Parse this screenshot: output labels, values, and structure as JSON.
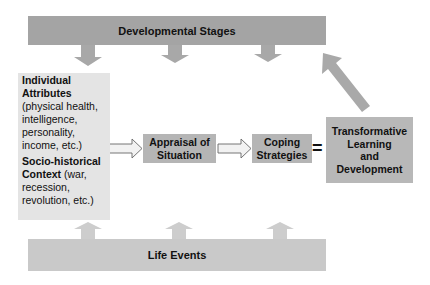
{
  "diagram": {
    "top_bar": {
      "label": "Developmental Stages"
    },
    "bottom_bar": {
      "label": "Life Events"
    },
    "left_box": {
      "attributes_title": "Individual Attributes",
      "attributes_detail": "(physical health, intelligence, personality, income, etc.)",
      "context_title": "Socio-historical Context",
      "context_detail": "(war, recession, revolution, etc.)"
    },
    "appraisal": {
      "label": "Appraisal of Situation"
    },
    "coping": {
      "label": "Coping Strategies"
    },
    "equals": {
      "symbol": "="
    },
    "outcome": {
      "line1": "Transformative",
      "line2": "Learning",
      "line3": "and",
      "line4": "Development"
    },
    "colors": {
      "top_bar": "#a4a4a4",
      "bottom_bar": "#c9c9c9",
      "left_box": "#e4e4e4",
      "process_box": "#b5b5b5",
      "arrow_down": "#a8a8a8",
      "arrow_up": "#cdcdcd"
    }
  }
}
